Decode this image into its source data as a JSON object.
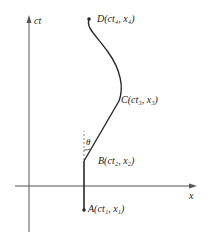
{
  "axes": {
    "y_label": "ct",
    "x_label": "x"
  },
  "points": {
    "A": {
      "name": "A",
      "label": "A(ct₁, x₁)"
    },
    "B": {
      "name": "B",
      "label": "B(ct₂, x₂)"
    },
    "C": {
      "name": "C",
      "label": "C(ct₃, x₃)"
    },
    "D": {
      "name": "D",
      "label": "D(ct₄, x₄)"
    }
  },
  "angle_label": "θ",
  "colors": {
    "line": "#2a2a2a",
    "axis": "#555555",
    "dash": "#888888"
  }
}
